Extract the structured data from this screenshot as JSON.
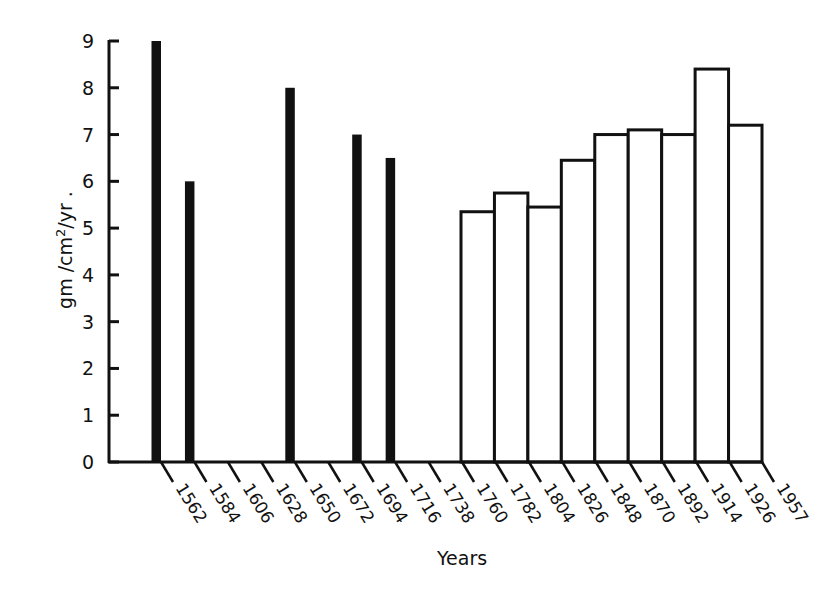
{
  "chart_data": {
    "type": "bar",
    "title": "",
    "xlabel": "Years",
    "ylabel": "gm/cm2/yr",
    "ylabel_superscript": "2",
    "ylim": [
      0,
      9
    ],
    "yticks": [
      0,
      1,
      2,
      3,
      4,
      5,
      6,
      7,
      8,
      9
    ],
    "xticks": [
      "1562",
      "1584",
      "1606",
      "1628",
      "1650",
      "1672",
      "1694",
      "1716",
      "1738",
      "1760",
      "1782",
      "1804",
      "1826",
      "1848",
      "1870",
      "1892",
      "1914",
      "1926",
      "1957"
    ],
    "grid": false,
    "legend": null,
    "series": [
      {
        "name": "dated samples (solid bars)",
        "style": "solid-black",
        "points": [
          {
            "x": "1562",
            "value": 9.0
          },
          {
            "x": "1584",
            "value": 6.0
          },
          {
            "x": "1650",
            "value": 8.0
          },
          {
            "x": "1694",
            "value": 7.0
          },
          {
            "x": "1716",
            "value": 6.5
          }
        ]
      },
      {
        "name": "interval averages (open bars)",
        "style": "outline",
        "intervals": [
          {
            "from": "1738",
            "to": "1760",
            "value": 5.35
          },
          {
            "from": "1760",
            "to": "1782",
            "value": 5.75
          },
          {
            "from": "1782",
            "to": "1804",
            "value": 5.45
          },
          {
            "from": "1804",
            "to": "1826",
            "value": 6.45
          },
          {
            "from": "1826",
            "to": "1848",
            "value": 7.0
          },
          {
            "from": "1848",
            "to": "1870",
            "value": 7.1
          },
          {
            "from": "1870",
            "to": "1892",
            "value": 7.0
          },
          {
            "from": "1892",
            "to": "1914",
            "value": 8.4
          },
          {
            "from": "1914",
            "to": "1926",
            "value": 7.2
          }
        ]
      }
    ]
  }
}
